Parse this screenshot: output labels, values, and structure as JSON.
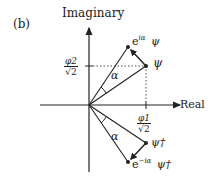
{
  "panel_label": "(b)",
  "axes": {
    "y_label": "Imaginary",
    "x_label": "Real"
  },
  "ticks": {
    "y_tick": {
      "num": "φ2",
      "den": "√2"
    },
    "x_tick": {
      "num": "φ1",
      "den": "√2"
    }
  },
  "angle_label_upper": "α",
  "angle_label_lower": "α",
  "points": {
    "psi": "ψ",
    "rot_psi_prefix": "e",
    "rot_psi_exp": "iα",
    "rot_psi_sym": "ψ",
    "psi_dag": "ψ†",
    "rot_psi_dag_prefix": "e",
    "rot_psi_dag_exp": "−iα",
    "rot_psi_dag_sym": "ψ†"
  },
  "colors": {
    "ink": "#222222"
  }
}
